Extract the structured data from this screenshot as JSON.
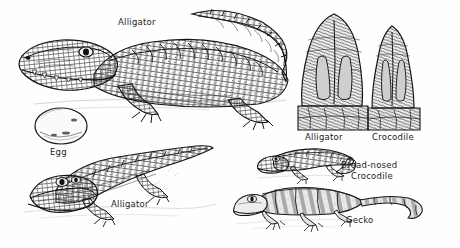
{
  "plate": {
    "title": "Reptiles engraving plate",
    "background_color": "#fefefe",
    "ink_color": "#1c1c1c",
    "style": "vintage pen-and-ink engraving"
  },
  "figures": [
    {
      "id": "alligator-main",
      "label": "Alligator",
      "icon": "alligator-icon",
      "description": "Large American alligator in profile facing left, curved tail raised",
      "label_x": 118,
      "label_y": 17,
      "box": {
        "x": 14,
        "y": 8,
        "w": 280,
        "h": 112
      }
    },
    {
      "id": "egg",
      "label": "Egg",
      "icon": "egg-icon",
      "description": "Oval speckled alligator egg",
      "label_x": 50,
      "label_y": 147,
      "box": {
        "x": 34,
        "y": 108,
        "w": 54,
        "h": 36
      }
    },
    {
      "id": "alligator-second",
      "label": "Alligator",
      "icon": "alligator-icon",
      "description": "Alligator in three-quarter view, head lower left, tail to upper right",
      "label_x": 111,
      "label_y": 199,
      "box": {
        "x": 24,
        "y": 138,
        "w": 190,
        "h": 86
      }
    },
    {
      "id": "snout-alligator",
      "label": "Alligator",
      "icon": "snout-icon",
      "description": "Broad rounded alligator snout, dorsal view",
      "label_x": 305,
      "label_y": 132,
      "box": {
        "x": 300,
        "y": 14,
        "w": 62,
        "h": 116
      }
    },
    {
      "id": "snout-crocodile",
      "label": "Crocodile",
      "icon": "snout-icon",
      "description": "Narrow pointed crocodile snout, dorsal view",
      "label_x": 372,
      "label_y": 132,
      "box": {
        "x": 368,
        "y": 26,
        "w": 52,
        "h": 104
      }
    },
    {
      "id": "broad-nosed-crocodile",
      "label_line1": "Broad-nosed",
      "label_line2": "Crocodile",
      "icon": "crocodile-icon",
      "description": "Broad-nosed crocodile walking right to left",
      "label_x": 341,
      "label_y": 160,
      "box": {
        "x": 258,
        "y": 146,
        "w": 96,
        "h": 34
      }
    },
    {
      "id": "gecko",
      "label": "Gecko",
      "icon": "gecko-icon",
      "description": "Banded gecko with long tapering tail, facing left",
      "label_x": 346,
      "label_y": 215,
      "box": {
        "x": 234,
        "y": 183,
        "w": 192,
        "h": 50
      }
    }
  ]
}
